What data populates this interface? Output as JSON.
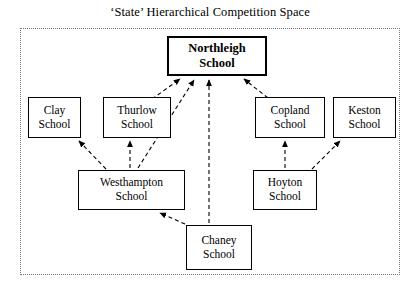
{
  "title": "‘State’ Hierarchical Competition Space",
  "diagram": {
    "boundary_label": "state-competition-space-boundary",
    "nodes": [
      {
        "id": "northleigh",
        "line1": "Northleigh",
        "line2": "School",
        "x": 167,
        "y": 36,
        "w": 100,
        "h": 40,
        "root": true
      },
      {
        "id": "clay",
        "line1": "Clay",
        "line2": "School",
        "x": 28,
        "y": 97,
        "w": 53,
        "h": 41,
        "root": false
      },
      {
        "id": "thurlow",
        "line1": "Thurlow",
        "line2": "School",
        "x": 103,
        "y": 97,
        "w": 68,
        "h": 41,
        "root": false
      },
      {
        "id": "copland",
        "line1": "Copland",
        "line2": "School",
        "x": 255,
        "y": 97,
        "w": 70,
        "h": 41,
        "root": false
      },
      {
        "id": "keston",
        "line1": "Keston",
        "line2": "School",
        "x": 333,
        "y": 97,
        "w": 63,
        "h": 41,
        "root": false
      },
      {
        "id": "westhampton",
        "line1": "Westhampton",
        "line2": "School",
        "x": 78,
        "y": 170,
        "w": 107,
        "h": 40,
        "root": false
      },
      {
        "id": "hoyton",
        "line1": "Hoyton",
        "line2": "School",
        "x": 253,
        "y": 170,
        "w": 64,
        "h": 40,
        "root": false
      },
      {
        "id": "chaney",
        "line1": "Chaney",
        "line2": "School",
        "x": 186,
        "y": 225,
        "w": 66,
        "h": 45,
        "root": false
      }
    ],
    "edges": [
      {
        "id": "thurlow-to-northleigh",
        "from": "thurlow",
        "to": "northleigh",
        "x1": 152,
        "y1": 99,
        "x2": 180,
        "y2": 79
      },
      {
        "id": "westhampton-to-northleigh",
        "from": "westhampton",
        "to": "northleigh",
        "x1": 138,
        "y1": 168,
        "x2": 194,
        "y2": 80
      },
      {
        "id": "chaney-to-northleigh",
        "from": "chaney",
        "to": "northleigh",
        "x1": 209,
        "y1": 223,
        "x2": 209,
        "y2": 80
      },
      {
        "id": "copland-to-northleigh",
        "from": "copland",
        "to": "northleigh",
        "x1": 268,
        "y1": 98,
        "x2": 244,
        "y2": 79
      },
      {
        "id": "westhampton-to-clay",
        "from": "westhampton",
        "to": "clay",
        "x1": 106,
        "y1": 169,
        "x2": 79,
        "y2": 141
      },
      {
        "id": "westhampton-to-thurlow",
        "from": "westhampton",
        "to": "thurlow",
        "x1": 130,
        "y1": 168,
        "x2": 130,
        "y2": 141
      },
      {
        "id": "chaney-to-westhampton",
        "from": "chaney",
        "to": "westhampton",
        "x1": 185,
        "y1": 224,
        "x2": 160,
        "y2": 213
      },
      {
        "id": "hoyton-to-copland",
        "from": "hoyton",
        "to": "copland",
        "x1": 285,
        "y1": 168,
        "x2": 285,
        "y2": 141
      },
      {
        "id": "hoyton-to-keston",
        "from": "hoyton",
        "to": "keston",
        "x1": 312,
        "y1": 169,
        "x2": 340,
        "y2": 141
      }
    ],
    "style": {
      "edge_color": "#000000",
      "edge_dash": "4,3",
      "node_border": "#000000",
      "boundary_border": "#777777",
      "background": "#ffffff"
    }
  }
}
